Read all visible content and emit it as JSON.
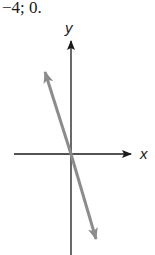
{
  "caption": "−4; 0.",
  "graph": {
    "x_axis_label": "x",
    "y_axis_label": "y",
    "line": {
      "description": "line through origin with negative slope",
      "color": "#8c8c8c",
      "passes_through": [
        0,
        0
      ]
    },
    "axis_color": "#1a1a1a"
  }
}
